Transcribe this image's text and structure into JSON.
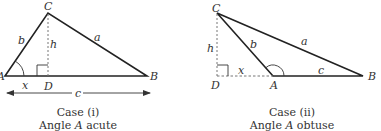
{
  "colors": {
    "line": "#222222",
    "text": "#333333",
    "dashed": "#666666"
  },
  "case1": {
    "vertices": {
      "A": "A",
      "B": "B",
      "C": "C",
      "D": "D"
    },
    "sides": {
      "a": "a",
      "b": "b",
      "c": "c",
      "h": "h",
      "x": "x"
    },
    "caption_line1": "Case (i)",
    "caption_line2_prefix": "Angle ",
    "caption_line2_var": "A",
    "caption_line2_suffix": " acute"
  },
  "case2": {
    "vertices": {
      "A": "A",
      "B": "B",
      "C": "C",
      "D": "D"
    },
    "sides": {
      "a": "a",
      "b": "b",
      "c": "c",
      "h": "h",
      "x": "x"
    },
    "caption_line1": "Case (ii)",
    "caption_line2_prefix": "Angle ",
    "caption_line2_var": "A",
    "caption_line2_suffix": " obtuse"
  }
}
